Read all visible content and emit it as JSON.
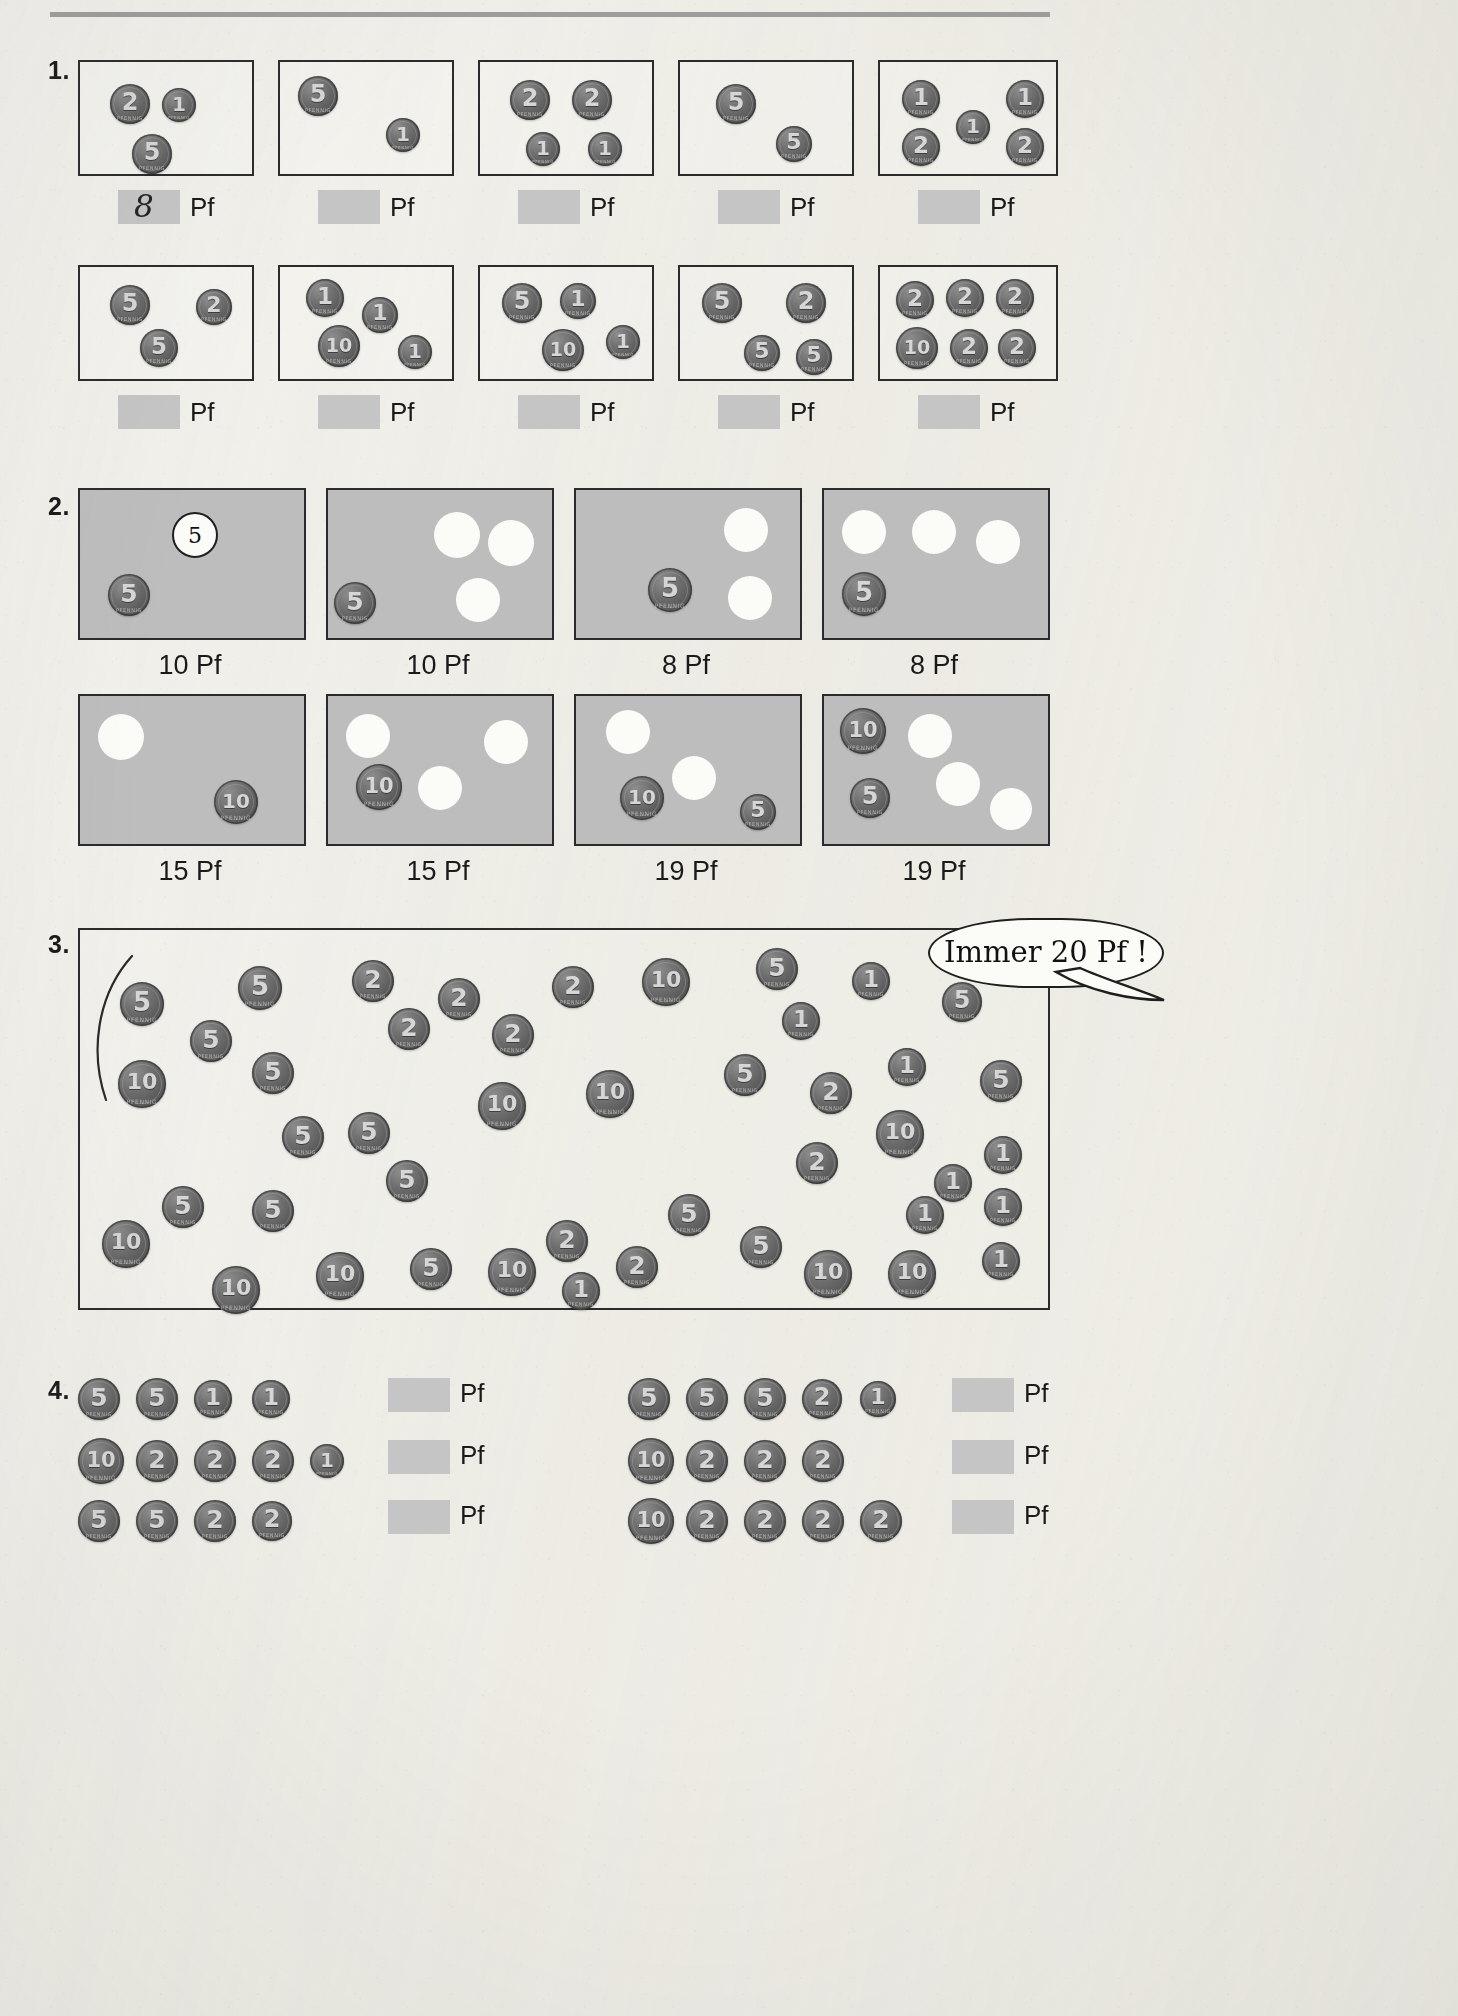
{
  "page": {
    "currency_label": "Pf",
    "coin_legend_text": "PFENNIG"
  },
  "exercises": [
    {
      "number": "1.",
      "rows": [
        {
          "boxes": [
            {
              "coins": [
                {
                  "v": "2",
                  "x": 30,
                  "y": 22,
                  "d": 40
                },
                {
                  "v": "1",
                  "x": 82,
                  "y": 26,
                  "d": 34
                },
                {
                  "v": "5",
                  "x": 52,
                  "y": 72,
                  "d": 40
                }
              ],
              "answer": "8",
              "answer_is_handwritten": true
            },
            {
              "coins": [
                {
                  "v": "5",
                  "x": 18,
                  "y": 14,
                  "d": 40
                },
                {
                  "v": "1",
                  "x": 106,
                  "y": 56,
                  "d": 34
                }
              ],
              "answer": "",
              "answer_is_handwritten": false
            },
            {
              "coins": [
                {
                  "v": "2",
                  "x": 30,
                  "y": 18,
                  "d": 40
                },
                {
                  "v": "2",
                  "x": 92,
                  "y": 18,
                  "d": 40
                },
                {
                  "v": "1",
                  "x": 46,
                  "y": 70,
                  "d": 34
                },
                {
                  "v": "1",
                  "x": 108,
                  "y": 70,
                  "d": 34
                }
              ],
              "answer": "",
              "answer_is_handwritten": false
            },
            {
              "coins": [
                {
                  "v": "5",
                  "x": 36,
                  "y": 22,
                  "d": 40
                },
                {
                  "v": "5",
                  "x": 96,
                  "y": 64,
                  "d": 36
                }
              ],
              "answer": "",
              "answer_is_handwritten": false
            },
            {
              "coins": [
                {
                  "v": "1",
                  "x": 22,
                  "y": 18,
                  "d": 38
                },
                {
                  "v": "1",
                  "x": 126,
                  "y": 18,
                  "d": 38
                },
                {
                  "v": "2",
                  "x": 22,
                  "y": 66,
                  "d": 38
                },
                {
                  "v": "1",
                  "x": 76,
                  "y": 48,
                  "d": 34
                },
                {
                  "v": "2",
                  "x": 126,
                  "y": 66,
                  "d": 38
                }
              ],
              "answer": "",
              "answer_is_handwritten": false
            }
          ]
        },
        {
          "boxes": [
            {
              "coins": [
                {
                  "v": "5",
                  "x": 30,
                  "y": 18,
                  "d": 40
                },
                {
                  "v": "2",
                  "x": 116,
                  "y": 22,
                  "d": 36
                },
                {
                  "v": "5",
                  "x": 60,
                  "y": 62,
                  "d": 38
                }
              ],
              "answer": "",
              "answer_is_handwritten": false
            },
            {
              "coins": [
                {
                  "v": "1",
                  "x": 26,
                  "y": 12,
                  "d": 38
                },
                {
                  "v": "1",
                  "x": 82,
                  "y": 30,
                  "d": 36
                },
                {
                  "v": "10",
                  "x": 38,
                  "y": 58,
                  "d": 42
                },
                {
                  "v": "1",
                  "x": 118,
                  "y": 68,
                  "d": 34
                }
              ],
              "answer": "",
              "answer_is_handwritten": false
            },
            {
              "coins": [
                {
                  "v": "5",
                  "x": 22,
                  "y": 16,
                  "d": 40
                },
                {
                  "v": "1",
                  "x": 80,
                  "y": 16,
                  "d": 36
                },
                {
                  "v": "10",
                  "x": 62,
                  "y": 62,
                  "d": 42
                },
                {
                  "v": "1",
                  "x": 126,
                  "y": 58,
                  "d": 34
                }
              ],
              "answer": "",
              "answer_is_handwritten": false
            },
            {
              "coins": [
                {
                  "v": "5",
                  "x": 22,
                  "y": 16,
                  "d": 40
                },
                {
                  "v": "2",
                  "x": 106,
                  "y": 16,
                  "d": 40
                },
                {
                  "v": "5",
                  "x": 64,
                  "y": 68,
                  "d": 36
                },
                {
                  "v": "5",
                  "x": 116,
                  "y": 72,
                  "d": 36
                }
              ],
              "answer": "",
              "answer_is_handwritten": false
            },
            {
              "coins": [
                {
                  "v": "2",
                  "x": 16,
                  "y": 14,
                  "d": 38
                },
                {
                  "v": "2",
                  "x": 66,
                  "y": 12,
                  "d": 38
                },
                {
                  "v": "2",
                  "x": 116,
                  "y": 12,
                  "d": 38
                },
                {
                  "v": "10",
                  "x": 16,
                  "y": 60,
                  "d": 42
                },
                {
                  "v": "2",
                  "x": 70,
                  "y": 62,
                  "d": 38
                },
                {
                  "v": "2",
                  "x": 118,
                  "y": 62,
                  "d": 38
                }
              ],
              "answer": "",
              "answer_is_handwritten": false
            }
          ]
        }
      ]
    },
    {
      "number": "2.",
      "rows": [
        {
          "boxes": [
            {
              "caption": "10 Pf",
              "coins": [
                {
                  "v": "5",
                  "x": 28,
                  "y": 84,
                  "d": 42
                }
              ],
              "blanks": [],
              "circle_num": {
                "value": "5",
                "x": 92,
                "y": 22,
                "d": 42
              }
            },
            {
              "caption": "10 Pf",
              "coins": [
                {
                  "v": "5",
                  "x": 6,
                  "y": 92,
                  "d": 42
                }
              ],
              "blanks": [
                {
                  "x": 106,
                  "y": 22,
                  "d": 46
                },
                {
                  "x": 160,
                  "y": 30,
                  "d": 46
                },
                {
                  "x": 128,
                  "y": 88,
                  "d": 44
                }
              ],
              "circle_num": null
            },
            {
              "caption": "8 Pf",
              "coins": [
                {
                  "v": "5",
                  "x": 72,
                  "y": 78,
                  "d": 44
                }
              ],
              "blanks": [
                {
                  "x": 148,
                  "y": 18,
                  "d": 44
                },
                {
                  "x": 152,
                  "y": 86,
                  "d": 44
                }
              ],
              "circle_num": null
            },
            {
              "caption": "8 Pf",
              "coins": [
                {
                  "v": "5",
                  "x": 18,
                  "y": 82,
                  "d": 44
                }
              ],
              "blanks": [
                {
                  "x": 18,
                  "y": 20,
                  "d": 44
                },
                {
                  "x": 88,
                  "y": 20,
                  "d": 44
                },
                {
                  "x": 152,
                  "y": 30,
                  "d": 44
                }
              ],
              "circle_num": null
            }
          ]
        },
        {
          "boxes": [
            {
              "caption": "15 Pf",
              "coins": [
                {
                  "v": "10",
                  "x": 134,
                  "y": 84,
                  "d": 44
                }
              ],
              "blanks": [
                {
                  "x": 18,
                  "y": 18,
                  "d": 46
                }
              ],
              "circle_num": null
            },
            {
              "caption": "15 Pf",
              "coins": [
                {
                  "v": "10",
                  "x": 28,
                  "y": 68,
                  "d": 46
                }
              ],
              "blanks": [
                {
                  "x": 18,
                  "y": 18,
                  "d": 44
                },
                {
                  "x": 90,
                  "y": 70,
                  "d": 44
                },
                {
                  "x": 156,
                  "y": 24,
                  "d": 44
                }
              ],
              "circle_num": null
            },
            {
              "caption": "19 Pf",
              "coins": [
                {
                  "v": "10",
                  "x": 44,
                  "y": 80,
                  "d": 44
                },
                {
                  "v": "5",
                  "x": 164,
                  "y": 98,
                  "d": 36
                }
              ],
              "blanks": [
                {
                  "x": 30,
                  "y": 14,
                  "d": 44
                },
                {
                  "x": 96,
                  "y": 60,
                  "d": 44
                }
              ],
              "circle_num": null
            },
            {
              "caption": "19 Pf",
              "coins": [
                {
                  "v": "10",
                  "x": 16,
                  "y": 12,
                  "d": 46
                },
                {
                  "v": "5",
                  "x": 26,
                  "y": 82,
                  "d": 40
                }
              ],
              "blanks": [
                {
                  "x": 84,
                  "y": 18,
                  "d": 44
                },
                {
                  "x": 112,
                  "y": 66,
                  "d": 44
                },
                {
                  "x": 166,
                  "y": 92,
                  "d": 42
                }
              ],
              "circle_num": null
            }
          ]
        }
      ]
    },
    {
      "number": "3.",
      "bubble_text": "Immer 20 Pf !",
      "scatter_coins": [
        {
          "v": "5",
          "x": 40,
          "y": 52,
          "d": 44
        },
        {
          "v": "5",
          "x": 158,
          "y": 36,
          "d": 44
        },
        {
          "v": "2",
          "x": 272,
          "y": 30,
          "d": 42
        },
        {
          "v": "2",
          "x": 358,
          "y": 48,
          "d": 42
        },
        {
          "v": "2",
          "x": 472,
          "y": 36,
          "d": 42
        },
        {
          "v": "10",
          "x": 562,
          "y": 28,
          "d": 48
        },
        {
          "v": "5",
          "x": 676,
          "y": 18,
          "d": 42
        },
        {
          "v": "1",
          "x": 772,
          "y": 32,
          "d": 38
        },
        {
          "v": "5",
          "x": 862,
          "y": 52,
          "d": 40
        },
        {
          "v": "5",
          "x": 110,
          "y": 90,
          "d": 42
        },
        {
          "v": "2",
          "x": 308,
          "y": 78,
          "d": 42
        },
        {
          "v": "2",
          "x": 412,
          "y": 84,
          "d": 42
        },
        {
          "v": "1",
          "x": 702,
          "y": 72,
          "d": 38
        },
        {
          "v": "10",
          "x": 38,
          "y": 130,
          "d": 48
        },
        {
          "v": "5",
          "x": 172,
          "y": 122,
          "d": 42
        },
        {
          "v": "10",
          "x": 398,
          "y": 152,
          "d": 48
        },
        {
          "v": "10",
          "x": 506,
          "y": 140,
          "d": 48
        },
        {
          "v": "5",
          "x": 644,
          "y": 124,
          "d": 42
        },
        {
          "v": "1",
          "x": 808,
          "y": 118,
          "d": 38
        },
        {
          "v": "5",
          "x": 900,
          "y": 130,
          "d": 42
        },
        {
          "v": "2",
          "x": 730,
          "y": 142,
          "d": 42
        },
        {
          "v": "10",
          "x": 796,
          "y": 180,
          "d": 48
        },
        {
          "v": "5",
          "x": 202,
          "y": 186,
          "d": 42
        },
        {
          "v": "5",
          "x": 268,
          "y": 182,
          "d": 42
        },
        {
          "v": "2",
          "x": 716,
          "y": 212,
          "d": 42
        },
        {
          "v": "1",
          "x": 904,
          "y": 206,
          "d": 38
        },
        {
          "v": "5",
          "x": 306,
          "y": 230,
          "d": 42
        },
        {
          "v": "1",
          "x": 854,
          "y": 234,
          "d": 38
        },
        {
          "v": "1",
          "x": 904,
          "y": 258,
          "d": 38
        },
        {
          "v": "5",
          "x": 82,
          "y": 256,
          "d": 42
        },
        {
          "v": "5",
          "x": 172,
          "y": 260,
          "d": 42
        },
        {
          "v": "5",
          "x": 588,
          "y": 264,
          "d": 42
        },
        {
          "v": "1",
          "x": 826,
          "y": 266,
          "d": 38
        },
        {
          "v": "2",
          "x": 466,
          "y": 290,
          "d": 42
        },
        {
          "v": "10",
          "x": 22,
          "y": 290,
          "d": 48
        },
        {
          "v": "5",
          "x": 660,
          "y": 296,
          "d": 42
        },
        {
          "v": "10",
          "x": 236,
          "y": 322,
          "d": 48
        },
        {
          "v": "5",
          "x": 330,
          "y": 318,
          "d": 42
        },
        {
          "v": "10",
          "x": 408,
          "y": 318,
          "d": 48
        },
        {
          "v": "2",
          "x": 536,
          "y": 316,
          "d": 42
        },
        {
          "v": "10",
          "x": 724,
          "y": 320,
          "d": 48
        },
        {
          "v": "10",
          "x": 808,
          "y": 320,
          "d": 48
        },
        {
          "v": "1",
          "x": 902,
          "y": 312,
          "d": 38
        },
        {
          "v": "10",
          "x": 132,
          "y": 336,
          "d": 48
        },
        {
          "v": "1",
          "x": 482,
          "y": 342,
          "d": 38
        }
      ]
    },
    {
      "number": "4.",
      "groups": [
        {
          "rows": [
            {
              "coins": [
                {
                  "v": "5",
                  "d": 42
                },
                {
                  "v": "5",
                  "d": 42
                },
                {
                  "v": "1",
                  "d": 38
                },
                {
                  "v": "1",
                  "d": 38
                }
              ]
            },
            {
              "coins": [
                {
                  "v": "10",
                  "d": 46
                },
                {
                  "v": "2",
                  "d": 42
                },
                {
                  "v": "2",
                  "d": 42
                },
                {
                  "v": "2",
                  "d": 42
                },
                {
                  "v": "1",
                  "d": 34
                }
              ]
            },
            {
              "coins": [
                {
                  "v": "5",
                  "d": 42
                },
                {
                  "v": "5",
                  "d": 42
                },
                {
                  "v": "2",
                  "d": 42
                },
                {
                  "v": "2",
                  "d": 40
                }
              ]
            }
          ],
          "answers": [
            "",
            "",
            ""
          ]
        },
        {
          "rows": [
            {
              "coins": [
                {
                  "v": "5",
                  "d": 42
                },
                {
                  "v": "5",
                  "d": 42
                },
                {
                  "v": "5",
                  "d": 42
                },
                {
                  "v": "2",
                  "d": 40
                },
                {
                  "v": "1",
                  "d": 36
                }
              ]
            },
            {
              "coins": [
                {
                  "v": "10",
                  "d": 46
                },
                {
                  "v": "2",
                  "d": 42
                },
                {
                  "v": "2",
                  "d": 42
                },
                {
                  "v": "2",
                  "d": 42
                }
              ]
            },
            {
              "coins": [
                {
                  "v": "10",
                  "d": 46
                },
                {
                  "v": "2",
                  "d": 42
                },
                {
                  "v": "2",
                  "d": 42
                },
                {
                  "v": "2",
                  "d": 42
                },
                {
                  "v": "2",
                  "d": 42
                }
              ]
            }
          ],
          "answers": [
            "",
            "",
            ""
          ]
        }
      ]
    }
  ]
}
